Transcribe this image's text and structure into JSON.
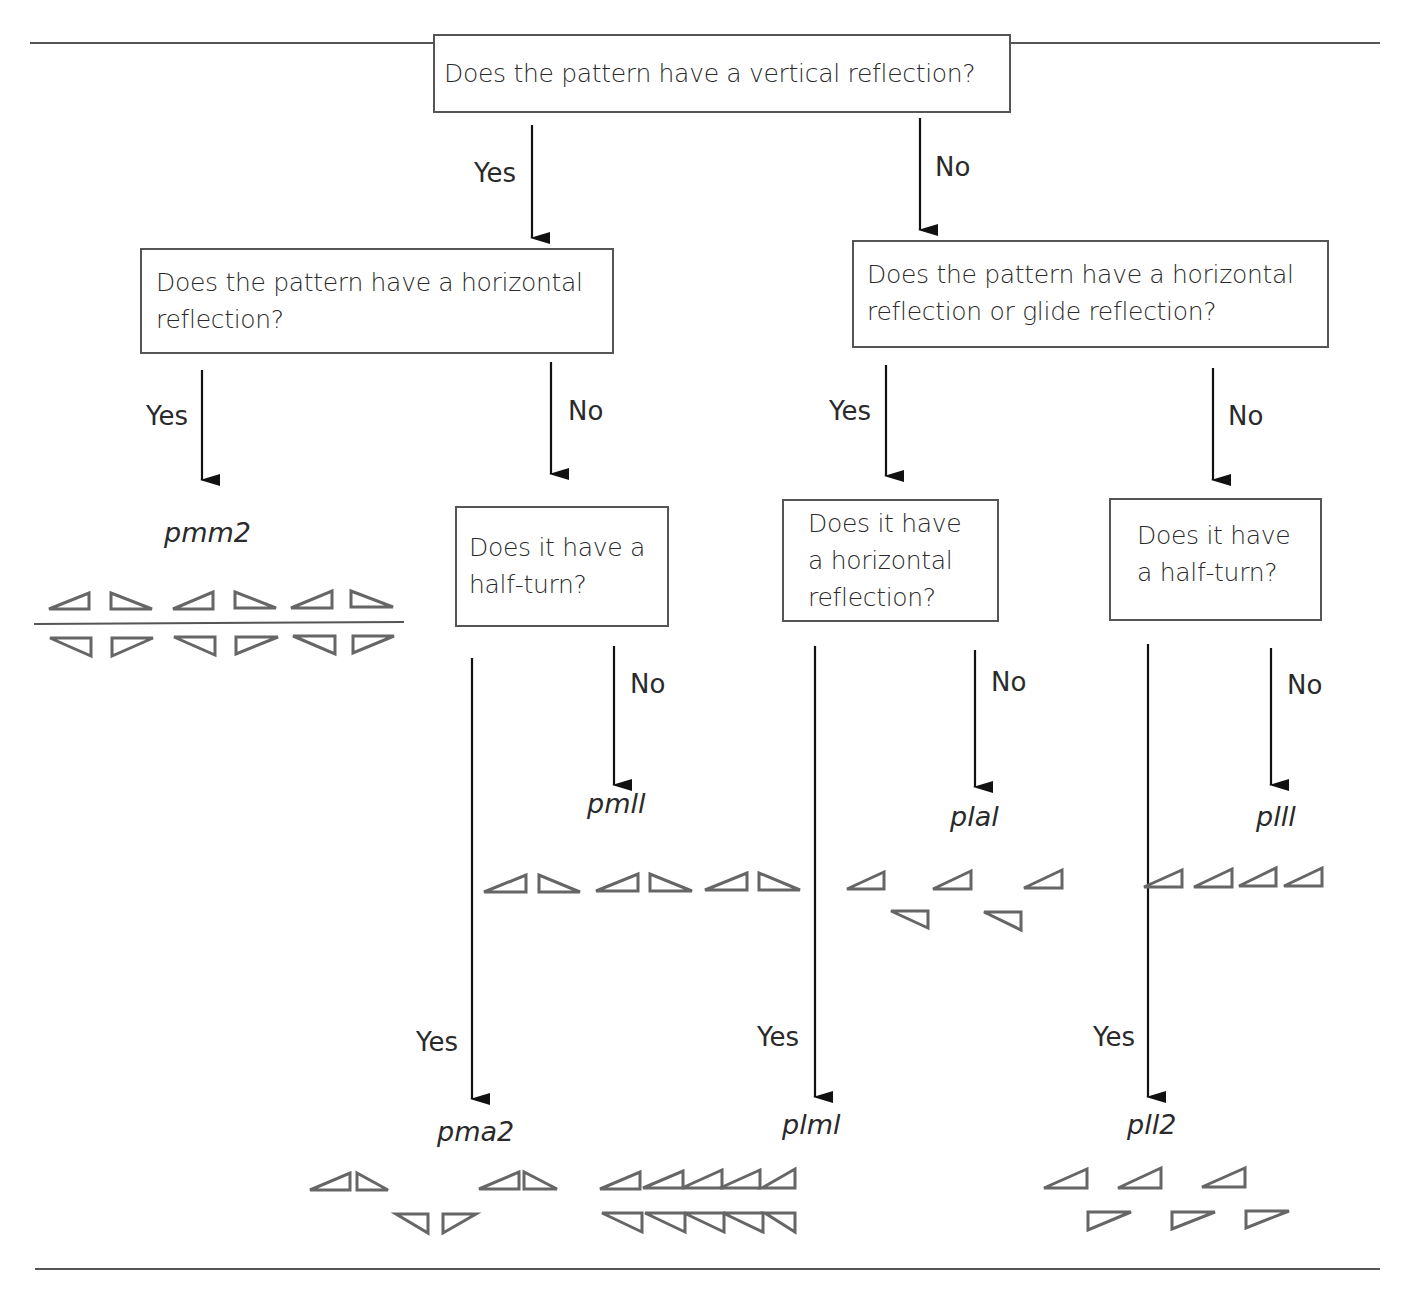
{
  "flowchart": {
    "q_root": "Does the pattern have a vertical reflection?",
    "q_left": [
      "Does the pattern have a horizontal",
      "reflection?"
    ],
    "q_right": [
      "Does the pattern have a horizontal",
      "reflection or glide reflection?"
    ],
    "q_ll": [
      "Does it have a",
      "half-turn?"
    ],
    "q_rl": [
      "Does it have",
      "a horizontal",
      "reflection?"
    ],
    "q_rr": [
      "Does it have",
      "a half-turn?"
    ],
    "yes": "Yes",
    "no": "No"
  },
  "groups": {
    "pmm2": "pmm2",
    "pm11": "pmll",
    "p1a1": "plal",
    "p111": "plll",
    "pma2": "pma2",
    "p1m1": "plml",
    "p112": "pll2"
  },
  "colors": {
    "line": "#555555",
    "text": "#2a2a2a",
    "triangle": "#666666"
  }
}
